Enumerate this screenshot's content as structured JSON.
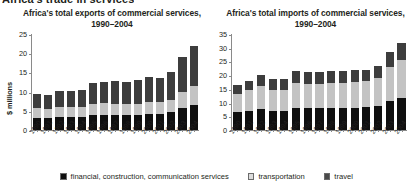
{
  "section_header": "Africa's trade in services",
  "legend": {
    "position": "bottom-center",
    "items": [
      {
        "label": "financial, construction, communication services",
        "color": "#0f0f0f",
        "key": "financial"
      },
      {
        "label": "transportation",
        "color": "#c3c3c3",
        "key": "transportation"
      },
      {
        "label": "travel",
        "color": "#3d3d3d",
        "key": "travel"
      }
    ]
  },
  "chart_data": [
    {
      "id": "exports",
      "type": "bar",
      "stacked": true,
      "title": "Africa's total exports of commercial services, 1990–2004",
      "xlabel": "",
      "ylabel": "$ millions",
      "ylim": [
        0,
        25
      ],
      "yticks": [
        0,
        5,
        10,
        15,
        20,
        25
      ],
      "grid": false,
      "categories": [
        "1990",
        "1991",
        "1992",
        "1993",
        "1994",
        "1995",
        "1996",
        "1997",
        "1998",
        "1999",
        "2000",
        "2001",
        "2002",
        "2003",
        "2004"
      ],
      "series": [
        {
          "name": "financial, construction, communication services",
          "color": "#0f0f0f",
          "values": [
            3.1,
            3.0,
            3.4,
            3.3,
            3.3,
            3.8,
            3.9,
            3.9,
            3.8,
            3.9,
            4.2,
            4.2,
            4.6,
            5.8,
            6.6
          ]
        },
        {
          "name": "transportation",
          "color": "#c3c3c3",
          "values": [
            2.6,
            2.6,
            2.7,
            2.6,
            2.7,
            3.1,
            3.1,
            3.0,
            2.9,
            2.9,
            3.0,
            3.0,
            3.3,
            4.1,
            4.8
          ]
        },
        {
          "name": "travel",
          "color": "#3d3d3d",
          "values": [
            3.8,
            3.6,
            4.1,
            4.2,
            4.5,
            5.3,
            5.5,
            5.8,
            5.9,
            6.2,
            6.6,
            6.3,
            7.1,
            9.1,
            10.6
          ]
        }
      ],
      "totals": [
        9.5,
        9.2,
        10.2,
        10.1,
        10.5,
        12.2,
        12.5,
        12.7,
        12.6,
        13.0,
        13.8,
        13.5,
        15.0,
        19.0,
        22.0
      ]
    },
    {
      "id": "imports",
      "type": "bar",
      "stacked": true,
      "title": "Africa's total imports of commercial services, 1990–2004",
      "xlabel": "",
      "ylabel": "",
      "ylim": [
        0,
        35
      ],
      "yticks": [
        0,
        5,
        10,
        15,
        20,
        25,
        30,
        35
      ],
      "grid": false,
      "categories": [
        "1990",
        "1991",
        "1992",
        "1993",
        "1994",
        "1995",
        "1996",
        "1997",
        "1998",
        "1999",
        "2000",
        "2001",
        "2002",
        "2003",
        "2004"
      ],
      "series": [
        {
          "name": "financial, construction, communication services",
          "color": "#0f0f0f",
          "values": [
            6.6,
            7.0,
            7.6,
            7.0,
            7.0,
            8.2,
            8.0,
            8.0,
            8.2,
            8.2,
            8.1,
            8.3,
            8.8,
            10.6,
            11.8
          ]
        },
        {
          "name": "transportation",
          "color": "#c3c3c3",
          "values": [
            6.7,
            7.5,
            8.3,
            7.6,
            7.7,
            9.1,
            8.9,
            8.8,
            9.0,
            9.1,
            9.3,
            9.4,
            10.0,
            12.2,
            13.8
          ]
        },
        {
          "name": "travel",
          "color": "#3d3d3d",
          "values": [
            3.2,
            3.5,
            4.1,
            3.9,
            3.8,
            4.2,
            4.1,
            4.2,
            4.3,
            4.4,
            4.4,
            4.3,
            4.7,
            5.5,
            6.2
          ]
        }
      ],
      "totals": [
        16.5,
        18.0,
        20.0,
        18.5,
        18.5,
        21.5,
        21.0,
        21.0,
        21.5,
        21.7,
        21.8,
        22.0,
        23.5,
        28.3,
        31.8
      ]
    }
  ]
}
